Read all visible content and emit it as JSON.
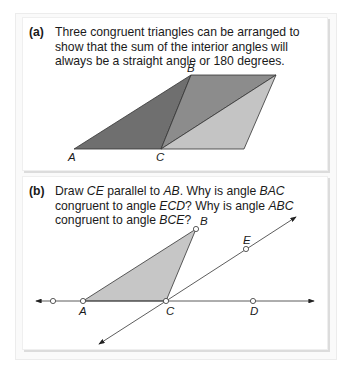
{
  "panels": [
    {
      "label": "(a)",
      "text": "Three congruent triangles can be arranged to show that the sum of the interior angles will always be a straight angle or 180 degrees.",
      "figure": {
        "points": {
          "A": "A",
          "B": "B",
          "C": "C"
        },
        "fills": {
          "left_triangle": "#6f6f6f",
          "middle_triangle": "#8c8c8c",
          "right_triangle": "#c4c4c4"
        }
      }
    },
    {
      "label": "(b)",
      "text_parts": [
        {
          "t": "Draw ",
          "i": false
        },
        {
          "t": "CE",
          "i": true
        },
        {
          "t": " parallel to ",
          "i": false
        },
        {
          "t": "AB",
          "i": true
        },
        {
          "t": ". Why is angle ",
          "i": false
        },
        {
          "t": "BAC",
          "i": true
        },
        {
          "t": " congruent to angle ",
          "i": false
        },
        {
          "t": "ECD",
          "i": true
        },
        {
          "t": "? Why is angle ",
          "i": false
        },
        {
          "t": "ABC",
          "i": true
        },
        {
          "t": " congruent to angle ",
          "i": false
        },
        {
          "t": "BCE",
          "i": true
        },
        {
          "t": "?",
          "i": false
        }
      ],
      "figure": {
        "points": {
          "A": "A",
          "B": "B",
          "C": "C",
          "D": "D",
          "E": "E"
        },
        "fills": {
          "triangle": "#c6c6c6"
        }
      }
    }
  ]
}
